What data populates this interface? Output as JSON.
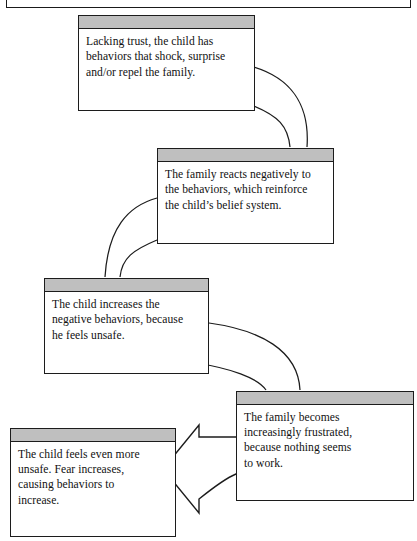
{
  "document": {
    "title": "Negative behavior cycle diagram",
    "page_rule": true
  },
  "colors": {
    "node_header_fill": "#bfbfbf",
    "node_border": "#1c1c1c",
    "node_body_fill": "#ffffff",
    "connector_stroke": "#1c1c1c",
    "arrow_fill": "#ffffff",
    "text": "#111111"
  },
  "diagram": {
    "type": "cycle",
    "node_count": 5,
    "nodes": [
      {
        "id": "node-1",
        "order": 1,
        "text": "Lacking trust, the child has behaviors that shock, surprise and/or repel the family.",
        "lines": [
          "Lacking trust, the child has",
          "behaviors that shock, surprise",
          "and/or repel the family."
        ]
      },
      {
        "id": "node-2",
        "order": 2,
        "text": "The family reacts negatively to the behaviors, which reinforce the child's belief system.",
        "lines": [
          "The family reacts negatively to",
          "the behaviors, which reinforce",
          "the child’s belief system."
        ]
      },
      {
        "id": "node-3",
        "order": 3,
        "text": "The child increases the negative behaviors, because he feels unsafe.",
        "lines": [
          "The child increases the",
          "negative behaviors, because",
          "he feels unsafe."
        ]
      },
      {
        "id": "node-4",
        "order": 4,
        "text": "The family becomes increasingly frustrated, because nothing seems to work.",
        "lines": [
          "The family becomes",
          "increasingly frustrated,",
          "because nothing seems",
          "to work."
        ]
      },
      {
        "id": "node-5",
        "order": 5,
        "text": "The child feels even more unsafe. Fear increases, causing behaviors to increase.",
        "lines": [
          "The child feels even more",
          "unsafe. Fear increases,",
          "causing behaviors to",
          "increase."
        ]
      }
    ],
    "connectors": [
      {
        "id": "connector-1-2",
        "from": "node-1",
        "to": "node-2",
        "style": "curved-ribbon"
      },
      {
        "id": "connector-2-3",
        "from": "node-2",
        "to": "node-3",
        "style": "curved-ribbon"
      },
      {
        "id": "connector-3-4",
        "from": "node-3",
        "to": "node-4",
        "style": "curved-ribbon"
      },
      {
        "id": "connector-4-5",
        "from": "node-4",
        "to": "node-5",
        "style": "curved-block-arrow"
      }
    ]
  }
}
